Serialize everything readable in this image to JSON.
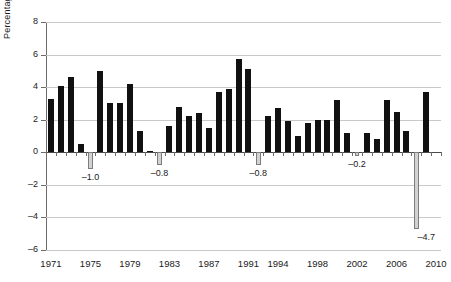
{
  "chart_data": {
    "type": "bar",
    "title": "",
    "subtitle": "",
    "xlabel": "",
    "ylabel": "Percentage",
    "ylim": [
      -6,
      8
    ],
    "ytick_values": [
      8,
      6,
      4,
      2,
      0,
      -2,
      -4,
      -6
    ],
    "ytick_labels": [
      "8",
      "6",
      "4",
      "2",
      "0",
      "–2",
      "–4",
      "–6"
    ],
    "grid": true,
    "legend": "none",
    "x_axis_labels": [
      "1971",
      "1975",
      "1979",
      "1983",
      "1987",
      "1991",
      "1994",
      "1998",
      "2002",
      "2006",
      "2010"
    ],
    "x_axis_label_years": [
      1971,
      1975,
      1979,
      1983,
      1987,
      1991,
      1994,
      1998,
      2002,
      2006,
      2010
    ],
    "categories": [
      "1971",
      "1972",
      "1973",
      "1974",
      "1975",
      "1976",
      "1977",
      "1978",
      "1979",
      "1980",
      "1981",
      "1982",
      "1983",
      "1984",
      "1985",
      "1986",
      "1987",
      "1988",
      "1989",
      "1990",
      "1991",
      "1992",
      "1993",
      "1994",
      "1995",
      "1996",
      "1997",
      "1998",
      "1999",
      "2000",
      "2001",
      "2002",
      "2003",
      "2004",
      "2005",
      "2006",
      "2007",
      "2008",
      "2009",
      "2010"
    ],
    "values": [
      3.3,
      4.1,
      4.6,
      0.5,
      -1.0,
      5.0,
      3.0,
      3.0,
      4.2,
      1.3,
      0.1,
      -0.8,
      1.6,
      2.8,
      2.2,
      2.4,
      1.5,
      3.7,
      3.9,
      5.7,
      5.1,
      -0.8,
      2.2,
      2.7,
      1.9,
      1.0,
      1.8,
      2.0,
      2.0,
      3.2,
      1.2,
      -0.2,
      1.2,
      0.8,
      3.2,
      2.5,
      1.3,
      -4.7,
      3.7,
      0
    ],
    "negative_data_labels": [
      {
        "category": "1975",
        "text": "–1.0",
        "value": -1.0
      },
      {
        "category": "1982",
        "text": "–0.8",
        "value": -0.8
      },
      {
        "category": "1992",
        "text": "–0.8",
        "value": -0.8
      },
      {
        "category": "2002",
        "text": "–0.2",
        "value": -0.2
      },
      {
        "category": "2009",
        "text": "–4.7",
        "value": -4.7
      }
    ],
    "colors": {
      "positive_bar": "#111111",
      "negative_bar_fill": "#d2d2d2",
      "negative_bar_stroke": "#7d7d7d",
      "gridline": "#c9c9c9",
      "axis": "#6b6b6b",
      "text": "#1a1a1a",
      "background": "#ffffff"
    }
  }
}
